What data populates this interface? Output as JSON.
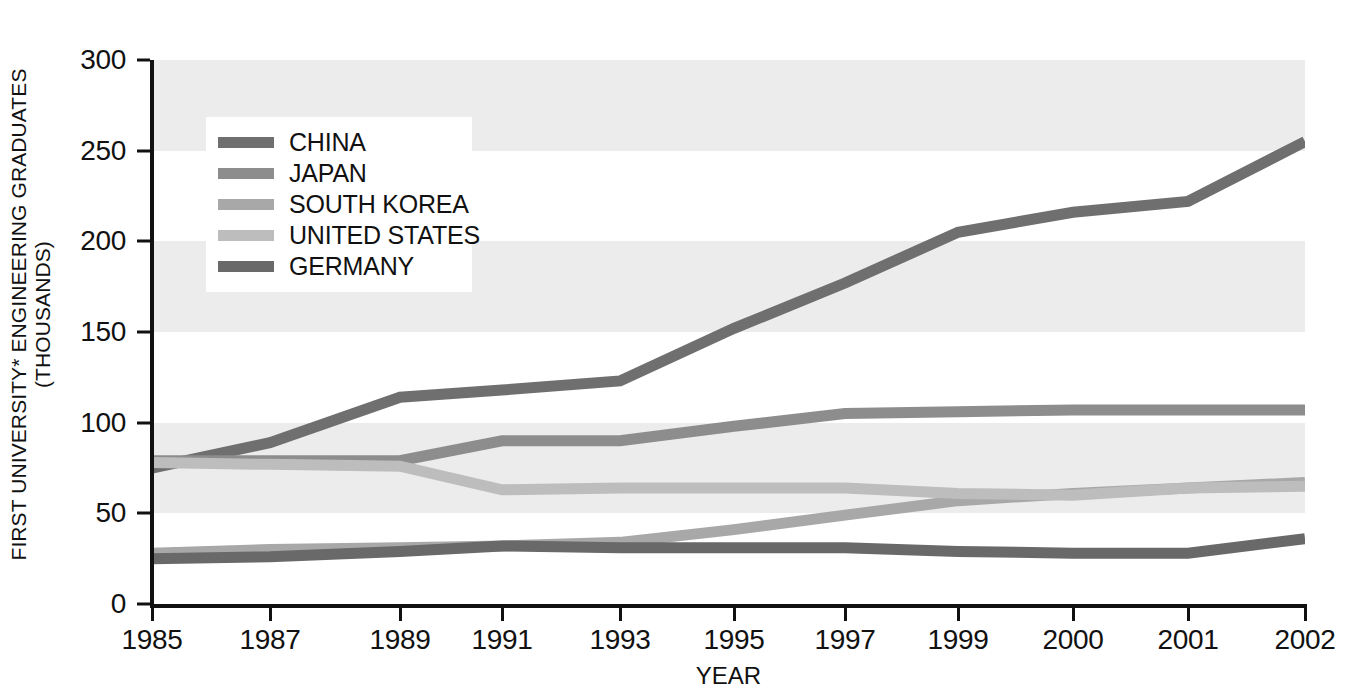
{
  "chart_data": {
    "type": "line",
    "title": "",
    "xlabel": "YEAR",
    "ylabel_line1": "FIRST UNIVERSITY* ENGINEERING GRADUATES",
    "ylabel_line2": "(THOUSANDS)",
    "categories": [
      "1985",
      "1987",
      "1989",
      "1991",
      "1993",
      "1995",
      "1997",
      "1999",
      "2000",
      "2001",
      "2002"
    ],
    "ylim": [
      0,
      300
    ],
    "yticks": [
      0,
      50,
      100,
      150,
      200,
      250,
      300
    ],
    "grid": false,
    "banded_background": true,
    "band_color": "#ececec",
    "legend_position": "top-left-inside",
    "series": [
      {
        "name": "CHINA",
        "color": "#6f6f6f",
        "values": [
          75,
          89,
          114,
          118,
          123,
          152,
          177,
          205,
          216,
          222,
          255
        ]
      },
      {
        "name": "JAPAN",
        "color": "#8d8d8d",
        "values": [
          79,
          79,
          79,
          90,
          90,
          98,
          105,
          106,
          107,
          107,
          107
        ]
      },
      {
        "name": "SOUTH KOREA",
        "color": "#a8a8a8",
        "values": [
          28,
          30,
          31,
          32,
          34,
          41,
          49,
          57,
          61,
          64,
          67
        ]
      },
      {
        "name": "UNITED STATES",
        "color": "#bdbdbd",
        "values": [
          78,
          77,
          76,
          63,
          64,
          64,
          64,
          61,
          60,
          64,
          65
        ]
      },
      {
        "name": "GERMANY",
        "color": "#696969",
        "values": [
          25,
          26,
          29,
          32,
          31,
          31,
          31,
          29,
          28,
          28,
          36
        ]
      }
    ]
  }
}
